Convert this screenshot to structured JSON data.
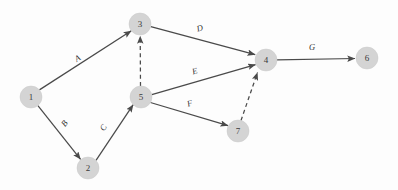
{
  "diagram": {
    "canvas": {
      "width": 398,
      "height": 190,
      "background": "#fdfdfd"
    },
    "style": {
      "node_fill": "#d4d4d4",
      "node_stroke": "#c9c9c9",
      "edge_color": "#4a4a4a",
      "label_color": "#2e2e2e",
      "node_radius": 11
    },
    "nodes": [
      {
        "id": "n1",
        "label": "1",
        "cx": 31,
        "cy": 97,
        "r": 11
      },
      {
        "id": "n2",
        "label": "2",
        "cx": 88,
        "cy": 168,
        "r": 11
      },
      {
        "id": "n3",
        "label": "3",
        "cx": 140,
        "cy": 24,
        "r": 11
      },
      {
        "id": "n4",
        "label": "4",
        "cx": 266,
        "cy": 60,
        "r": 11
      },
      {
        "id": "n5",
        "label": "5",
        "cx": 141,
        "cy": 97,
        "r": 11
      },
      {
        "id": "n6",
        "label": "6",
        "cx": 367,
        "cy": 58,
        "r": 11
      },
      {
        "id": "n7",
        "label": "7",
        "cx": 238,
        "cy": 131,
        "r": 11
      }
    ],
    "edges": [
      {
        "id": "e-a",
        "label": "A",
        "from": "n1",
        "to": "n3",
        "style": "solid",
        "x1": 39.4,
        "y1": 89.9,
        "x2": 131.3,
        "y2": 30.8,
        "lx": 78,
        "ly": 59,
        "rot": -32
      },
      {
        "id": "e-b",
        "label": "B",
        "from": "n1",
        "to": "n2",
        "style": "solid",
        "x1": 37.9,
        "y1": 105.6,
        "x2": 80.6,
        "y2": 159.4,
        "lx": 65,
        "ly": 124,
        "rot": -52
      },
      {
        "id": "e-c",
        "label": "C",
        "from": "n2",
        "to": "n5",
        "style": "solid",
        "x1": 96.0,
        "y1": 160.4,
        "x2": 133.2,
        "y2": 104.6,
        "lx": 104,
        "ly": 128,
        "rot": -56
      },
      {
        "id": "e-d",
        "label": "D",
        "from": "n3",
        "to": "n4",
        "style": "solid",
        "x1": 150.8,
        "y1": 26.7,
        "x2": 255.2,
        "y2": 54.6,
        "lx": 200,
        "ly": 29,
        "rot": -15
      },
      {
        "id": "e-e",
        "label": "E",
        "from": "n5",
        "to": "n4",
        "style": "solid",
        "x1": 151.8,
        "y1": 94.6,
        "x2": 255.6,
        "y2": 64.6,
        "lx": 195,
        "ly": 72,
        "rot": -16
      },
      {
        "id": "e-f",
        "label": "F",
        "from": "n5",
        "to": "n7",
        "style": "solid",
        "x1": 150.4,
        "y1": 102.5,
        "x2": 228.1,
        "y2": 125.7,
        "lx": 190,
        "ly": 104,
        "rot": -17
      },
      {
        "id": "e-g",
        "label": "G",
        "from": "n4",
        "to": "n6",
        "style": "solid",
        "x1": 277.0,
        "y1": 59.8,
        "x2": 355.0,
        "y2": 58.5,
        "lx": 312,
        "ly": 48,
        "rot": 0
      },
      {
        "id": "e-d1",
        "label": "",
        "from": "n5",
        "to": "n3",
        "style": "dashed",
        "x1": 140.5,
        "y1": 86.0,
        "x2": 140.2,
        "y2": 36.0,
        "lx": 0,
        "ly": 0,
        "rot": 0
      },
      {
        "id": "e-d2",
        "label": "",
        "from": "n7",
        "to": "n4",
        "style": "dashed",
        "x1": 241.0,
        "y1": 120.5,
        "x2": 257.5,
        "y2": 72.5,
        "lx": 0,
        "ly": 0,
        "rot": 0
      }
    ]
  }
}
